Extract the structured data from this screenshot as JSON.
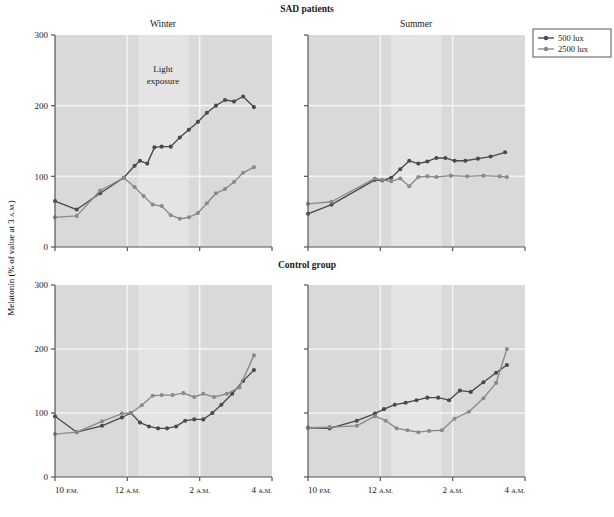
{
  "figure": {
    "group_titles": [
      {
        "name": "sad",
        "label": "SAD patients"
      },
      {
        "name": "control",
        "label": "Control group"
      }
    ],
    "panel_titles": [
      {
        "name": "winter",
        "label": "Winter"
      },
      {
        "name": "summer",
        "label": "Summer"
      }
    ],
    "y_axis_label": "Melatonin (% of value at 3 A.M.)",
    "y_axis_label_parts": {
      "main": "Melatonin (% of value at 3 ",
      "sub": "A.M.",
      "tail": ")"
    },
    "annotation": {
      "name": "light-exposure",
      "line1": "Light",
      "line2": "exposure"
    },
    "legend": {
      "position": "top-right",
      "entries": [
        {
          "label": "500 lux",
          "color": "#4a4a4a"
        },
        {
          "label": "2500 lux",
          "color": "#8a8a8a"
        }
      ]
    },
    "colors": {
      "plot_background": "#d9d9d9",
      "light_band": "#e4e4e4",
      "gridline": "#f2f2f2",
      "axis": "#555555",
      "series_500": "#4a4a4a",
      "series_2500": "#8a8a8a"
    }
  },
  "chart_data": {
    "type": "line",
    "xlabel": "",
    "ylabel": "Melatonin (% of value at 3 A.M.)",
    "ylim": [
      0,
      300
    ],
    "yticks": [
      0,
      100,
      200,
      300
    ],
    "xlim": [
      22.0,
      28.0
    ],
    "xticks": [
      22,
      24,
      26,
      28
    ],
    "xticklabels": [
      "10 P.M.",
      "12 A.M.",
      "2 A.M.",
      "4 A.M."
    ],
    "grid": true,
    "light_exposure_window": [
      24.3,
      25.7
    ],
    "legend": [
      "500 lux",
      "2500 lux"
    ],
    "panels": [
      {
        "name": "sad-winter",
        "row": "SAD patients",
        "column": "Winter",
        "series": [
          {
            "name": "500 lux",
            "color": "#4a4a4a",
            "x": [
              22.0,
              22.6,
              23.25,
              23.9,
              24.2,
              24.35,
              24.55,
              24.75,
              24.95,
              25.2,
              25.45,
              25.7,
              25.95,
              26.2,
              26.45,
              26.7,
              26.95,
              27.2,
              27.5
            ],
            "y": [
              65,
              53,
              76,
              98,
              115,
              122,
              118,
              141,
              142,
              142,
              155,
              166,
              177,
              190,
              200,
              208,
              206,
              213,
              198
            ]
          },
          {
            "name": "2500 lux",
            "color": "#8a8a8a",
            "x": [
              22.0,
              22.6,
              23.25,
              23.9,
              24.2,
              24.45,
              24.7,
              24.95,
              25.2,
              25.45,
              25.7,
              25.95,
              26.2,
              26.45,
              26.7,
              26.95,
              27.2,
              27.5
            ],
            "y": [
              42,
              44,
              80,
              98,
              85,
              72,
              60,
              58,
              45,
              40,
              42,
              48,
              62,
              76,
              82,
              92,
              105,
              113
            ]
          }
        ]
      },
      {
        "name": "sad-summer",
        "row": "SAD patients",
        "column": "Summer",
        "series": [
          {
            "name": "500 lux",
            "color": "#4a4a4a",
            "x": [
              22.0,
              22.65,
              23.85,
              24.05,
              24.3,
              24.55,
              24.8,
              25.05,
              25.3,
              25.55,
              25.8,
              26.05,
              26.35,
              26.7,
              27.05,
              27.45
            ],
            "y": [
              47,
              60,
              95,
              94,
              98,
              110,
              122,
              118,
              121,
              126,
              126,
              122,
              122,
              125,
              128,
              134
            ]
          },
          {
            "name": "2500 lux",
            "color": "#8a8a8a",
            "x": [
              22.0,
              22.65,
              23.85,
              24.05,
              24.3,
              24.55,
              24.8,
              25.05,
              25.3,
              25.55,
              25.95,
              26.4,
              26.85,
              27.3,
              27.5
            ],
            "y": [
              61,
              64,
              97,
              95,
              93,
              97,
              86,
              99,
              100,
              99,
              101,
              100,
              101,
              100,
              99
            ]
          }
        ]
      },
      {
        "name": "control-winter",
        "row": "Control group",
        "column": "Winter",
        "series": [
          {
            "name": "500 lux",
            "color": "#4a4a4a",
            "x": [
              22.0,
              22.6,
              23.3,
              23.85,
              24.1,
              24.35,
              24.6,
              24.85,
              25.1,
              25.35,
              25.6,
              25.85,
              26.1,
              26.35,
              26.6,
              26.9,
              27.2,
              27.5
            ],
            "y": [
              95,
              70,
              80,
              93,
              100,
              85,
              79,
              76,
              76,
              79,
              88,
              90,
              90,
              100,
              113,
              130,
              150,
              167
            ]
          },
          {
            "name": "2500 lux",
            "color": "#8a8a8a",
            "x": [
              22.0,
              22.6,
              23.3,
              23.85,
              24.1,
              24.4,
              24.7,
              24.95,
              25.25,
              25.55,
              25.85,
              26.1,
              26.4,
              26.75,
              27.1,
              27.5
            ],
            "y": [
              67,
              70,
              87,
              99,
              100,
              112,
              127,
              128,
              128,
              131,
              125,
              130,
              125,
              130,
              140,
              190
            ]
          }
        ]
      },
      {
        "name": "control-summer",
        "row": "Control group",
        "column": "Summer",
        "series": [
          {
            "name": "500 lux",
            "color": "#4a4a4a",
            "x": [
              22.0,
              22.6,
              23.35,
              23.85,
              24.1,
              24.4,
              24.7,
              25.0,
              25.3,
              25.6,
              25.9,
              26.2,
              26.5,
              26.85,
              27.2,
              27.5
            ],
            "y": [
              77,
              76,
              88,
              99,
              106,
              113,
              116,
              120,
              124,
              124,
              120,
              135,
              133,
              148,
              163,
              175
            ]
          },
          {
            "name": "2500 lux",
            "color": "#8a8a8a",
            "x": [
              22.0,
              22.6,
              23.35,
              23.85,
              24.15,
              24.45,
              24.75,
              25.05,
              25.35,
              25.7,
              26.05,
              26.45,
              26.85,
              27.2,
              27.5
            ],
            "y": [
              77,
              78,
              80,
              95,
              88,
              76,
              73,
              70,
              72,
              73,
              91,
              102,
              123,
              147,
              200
            ]
          }
        ]
      }
    ]
  }
}
